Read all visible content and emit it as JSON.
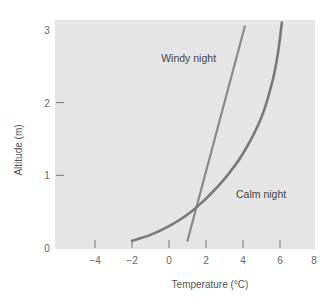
{
  "chart_data": {
    "type": "line",
    "title": "",
    "xlabel": "Temperature (°C)",
    "ylabel": "Altitude (m)",
    "xlim": [
      -6,
      8
    ],
    "ylim": [
      0,
      3.1
    ],
    "x_ticks": [
      -4,
      -2,
      0,
      2,
      4,
      6,
      8
    ],
    "x_tick_labels": [
      "−4",
      "−2",
      "0",
      "2",
      "4",
      "6",
      "8"
    ],
    "y_ticks": [
      0,
      1,
      2,
      3
    ],
    "y_tick_labels": [
      "0",
      "1",
      "2",
      "3"
    ],
    "grid": false,
    "legend": "none (inline annotations)",
    "series": [
      {
        "name": "Windy night",
        "color": "#8a8a8a",
        "x": [
          1.0,
          1.5,
          2.0,
          2.5,
          3.0,
          3.5,
          4.1
        ],
        "y": [
          0.1,
          0.55,
          1.0,
          1.5,
          2.0,
          2.5,
          3.05
        ]
      },
      {
        "name": "Calm night",
        "color": "#7a7a7a",
        "x": [
          -2.0,
          -1.0,
          0.0,
          1.0,
          2.0,
          3.0,
          4.0,
          5.0,
          5.6,
          5.9,
          6.1
        ],
        "y": [
          0.1,
          0.18,
          0.3,
          0.46,
          0.68,
          0.95,
          1.3,
          1.8,
          2.3,
          2.7,
          3.1
        ]
      }
    ],
    "annotations": [
      {
        "text": "Windy night",
        "x": 1.2,
        "y": 2.55
      },
      {
        "text": "Calm night",
        "x": 4.7,
        "y": 0.62
      }
    ],
    "plot_background": "#e6e6e6"
  }
}
